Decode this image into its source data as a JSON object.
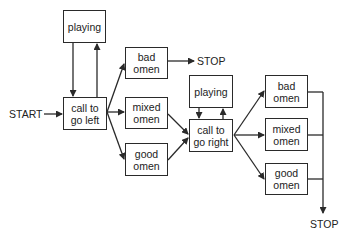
{
  "diagram": {
    "type": "flowchart",
    "nodes": {
      "start": {
        "label": "START"
      },
      "stop_top": {
        "label": "STOP"
      },
      "stop_bottom": {
        "label": "STOP"
      },
      "playing_left": {
        "label": "playing"
      },
      "call_left": {
        "label": "call to\ngo left"
      },
      "bad_left": {
        "label": "bad\nomen"
      },
      "mixed_left": {
        "label": "mixed\nomen"
      },
      "good_left": {
        "label": "good\nomen"
      },
      "playing_right": {
        "label": "playing"
      },
      "call_right": {
        "label": "call to\ngo right"
      },
      "bad_right": {
        "label": "bad\nomen"
      },
      "mixed_right": {
        "label": "mixed\nomen"
      },
      "good_right": {
        "label": "good\nomen"
      }
    },
    "edges": [
      {
        "from": "start",
        "to": "call_left"
      },
      {
        "from": "playing_left",
        "to": "call_left"
      },
      {
        "from": "call_left",
        "to": "playing_left"
      },
      {
        "from": "call_left",
        "to": "bad_left"
      },
      {
        "from": "call_left",
        "to": "mixed_left"
      },
      {
        "from": "call_left",
        "to": "good_left"
      },
      {
        "from": "bad_left",
        "to": "stop_top"
      },
      {
        "from": "mixed_left",
        "to": "call_right"
      },
      {
        "from": "good_left",
        "to": "call_right"
      },
      {
        "from": "playing_right",
        "to": "call_right"
      },
      {
        "from": "call_right",
        "to": "playing_right"
      },
      {
        "from": "call_right",
        "to": "bad_right"
      },
      {
        "from": "call_right",
        "to": "mixed_right"
      },
      {
        "from": "call_right",
        "to": "good_right"
      },
      {
        "from": "bad_right",
        "to": "stop_bottom"
      },
      {
        "from": "mixed_right",
        "to": "stop_bottom"
      },
      {
        "from": "good_right",
        "to": "stop_bottom"
      }
    ],
    "colors": {
      "line": "#2a2a2a",
      "background": "#ffffff"
    }
  }
}
